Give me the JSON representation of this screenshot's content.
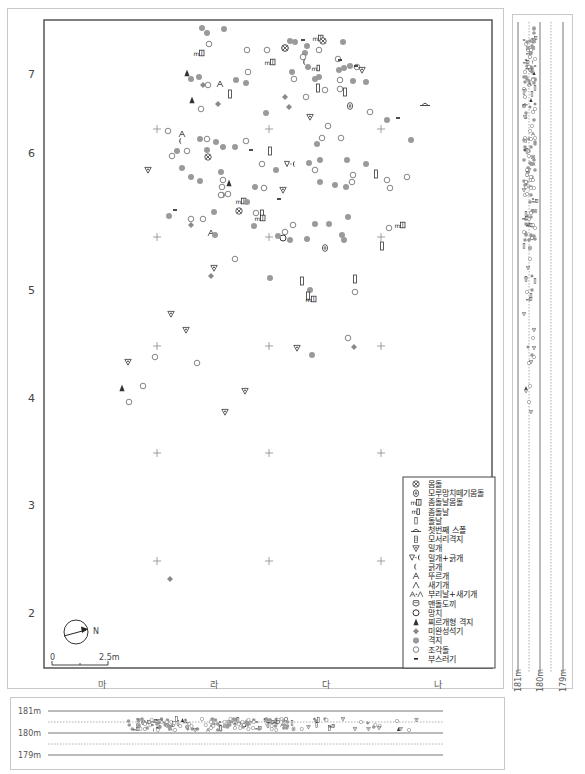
{
  "plan": {
    "y_axis_labels": [
      {
        "text": "7",
        "y": 78
      },
      {
        "text": "6",
        "y": 157
      },
      {
        "text": "5",
        "y": 294
      },
      {
        "text": "4",
        "y": 402
      },
      {
        "text": "3",
        "y": 509
      },
      {
        "text": "2",
        "y": 617
      }
    ],
    "x_axis_labels": [
      {
        "text": "마",
        "x": 102
      },
      {
        "text": "라",
        "x": 214
      },
      {
        "text": "다",
        "x": 326
      },
      {
        "text": "나",
        "x": 438
      }
    ],
    "north_label": "N",
    "scale": {
      "start": "0",
      "end": "2.5m"
    }
  },
  "legend": {
    "items": [
      {
        "symbol": "core",
        "label": "몸돌"
      },
      {
        "symbol": "anvil-core",
        "label": "모루망치떼기몸돌"
      },
      {
        "symbol": "microblade-core",
        "label": "좀돌날몸돌"
      },
      {
        "symbol": "microblade",
        "label": "좀돌날"
      },
      {
        "symbol": "blade",
        "label": "돌날"
      },
      {
        "symbol": "first-spall",
        "label": "첫번째 스폴"
      },
      {
        "symbol": "corner-flake",
        "label": "모서리격지"
      },
      {
        "symbol": "endscraper",
        "label": "밀개"
      },
      {
        "symbol": "endscraper-sidescraper",
        "label": "밀개+긁개"
      },
      {
        "symbol": "sidescraper",
        "label": "긁개"
      },
      {
        "symbol": "borer",
        "label": "뚜르개"
      },
      {
        "symbol": "burin",
        "label": "새기개"
      },
      {
        "symbol": "beak-burin",
        "label": "부리날+새기개"
      },
      {
        "symbol": "polished-axe",
        "label": "맨돌도끼"
      },
      {
        "symbol": "hammer",
        "label": "망치"
      },
      {
        "symbol": "point-flake",
        "label": "찌르개형 격지"
      },
      {
        "symbol": "unfinished",
        "label": "미완성석기"
      },
      {
        "symbol": "flake",
        "label": "격지"
      },
      {
        "symbol": "chunk",
        "label": "조각돌"
      },
      {
        "symbol": "debris",
        "label": "부스러기"
      }
    ]
  },
  "grid_crosses": [
    [
      157,
      129
    ],
    [
      269,
      129
    ],
    [
      381,
      129
    ],
    [
      157,
      237
    ],
    [
      269,
      237
    ],
    [
      381,
      237
    ],
    [
      157,
      346
    ],
    [
      269,
      346
    ],
    [
      381,
      346
    ],
    [
      157,
      453
    ],
    [
      269,
      453
    ],
    [
      381,
      453
    ],
    [
      157,
      561
    ],
    [
      269,
      561
    ],
    [
      381,
      561
    ]
  ],
  "artifacts": [
    {
      "t": "flake",
      "x": 202,
      "y": 28
    },
    {
      "t": "flake",
      "x": 207,
      "y": 33
    },
    {
      "t": "flake",
      "x": 224,
      "y": 29
    },
    {
      "t": "chunk",
      "x": 209,
      "y": 44
    },
    {
      "t": "microblade-core",
      "x": 199,
      "y": 53
    },
    {
      "t": "chunk",
      "x": 247,
      "y": 50
    },
    {
      "t": "core",
      "x": 285,
      "y": 48
    },
    {
      "t": "chunk",
      "x": 267,
      "y": 50
    },
    {
      "t": "microblade-core",
      "x": 270,
      "y": 62
    },
    {
      "t": "point-flake",
      "x": 187,
      "y": 73
    },
    {
      "t": "flake",
      "x": 191,
      "y": 79
    },
    {
      "t": "flake",
      "x": 199,
      "y": 77
    },
    {
      "t": "unfinished",
      "x": 203,
      "y": 85
    },
    {
      "t": "chunk",
      "x": 208,
      "y": 85
    },
    {
      "t": "borer",
      "x": 220,
      "y": 84
    },
    {
      "t": "flake",
      "x": 236,
      "y": 80
    },
    {
      "t": "flake",
      "x": 246,
      "y": 83
    },
    {
      "t": "chunk",
      "x": 248,
      "y": 72
    },
    {
      "t": "blade",
      "x": 230,
      "y": 94
    },
    {
      "t": "point-flake",
      "x": 192,
      "y": 100
    },
    {
      "t": "chunk",
      "x": 201,
      "y": 109
    },
    {
      "t": "unfinished",
      "x": 218,
      "y": 104
    },
    {
      "t": "unfinished",
      "x": 285,
      "y": 97
    },
    {
      "t": "unfinished",
      "x": 289,
      "y": 107
    },
    {
      "t": "flake",
      "x": 266,
      "y": 113
    },
    {
      "t": "core",
      "x": 285,
      "y": 48
    },
    {
      "t": "flake",
      "x": 295,
      "y": 42
    },
    {
      "t": "debris",
      "x": 303,
      "y": 40
    },
    {
      "t": "microblade-core",
      "x": 318,
      "y": 38
    },
    {
      "t": "core",
      "x": 323,
      "y": 41
    },
    {
      "t": "chunk",
      "x": 319,
      "y": 50
    },
    {
      "t": "flake",
      "x": 307,
      "y": 46
    },
    {
      "t": "flake",
      "x": 305,
      "y": 53
    },
    {
      "t": "chunk",
      "x": 303,
      "y": 57
    },
    {
      "t": "sidescraper",
      "x": 305,
      "y": 62
    },
    {
      "t": "flake",
      "x": 308,
      "y": 67
    },
    {
      "t": "microblade",
      "x": 316,
      "y": 68
    },
    {
      "t": "flake",
      "x": 319,
      "y": 77
    },
    {
      "t": "flake",
      "x": 315,
      "y": 79
    },
    {
      "t": "chunk",
      "x": 294,
      "y": 79
    },
    {
      "t": "flake",
      "x": 292,
      "y": 72
    },
    {
      "t": "blade",
      "x": 318,
      "y": 88
    },
    {
      "t": "chunk",
      "x": 325,
      "y": 90
    },
    {
      "t": "chunk",
      "x": 306,
      "y": 97
    },
    {
      "t": "flake",
      "x": 343,
      "y": 42
    },
    {
      "t": "chunk",
      "x": 338,
      "y": 59
    },
    {
      "t": "debris",
      "x": 340,
      "y": 60
    },
    {
      "t": "flake",
      "x": 339,
      "y": 70
    },
    {
      "t": "flake",
      "x": 344,
      "y": 68
    },
    {
      "t": "flake",
      "x": 350,
      "y": 66
    },
    {
      "t": "chunk",
      "x": 357,
      "y": 67
    },
    {
      "t": "debris",
      "x": 356,
      "y": 66
    },
    {
      "t": "endscraper",
      "x": 362,
      "y": 70
    },
    {
      "t": "chunk",
      "x": 340,
      "y": 80
    },
    {
      "t": "flake",
      "x": 353,
      "y": 81
    },
    {
      "t": "flake",
      "x": 366,
      "y": 82
    },
    {
      "t": "chunk",
      "x": 340,
      "y": 89
    },
    {
      "t": "blade",
      "x": 345,
      "y": 92
    },
    {
      "t": "anvil-core",
      "x": 350,
      "y": 106
    },
    {
      "t": "chunk",
      "x": 370,
      "y": 112
    },
    {
      "t": "debris",
      "x": 398,
      "y": 118
    },
    {
      "t": "flake",
      "x": 387,
      "y": 120
    },
    {
      "t": "first-spall",
      "x": 425,
      "y": 104
    },
    {
      "t": "endscraper",
      "x": 310,
      "y": 117
    },
    {
      "t": "chunk",
      "x": 328,
      "y": 126
    },
    {
      "t": "cross-fake",
      "x": 0,
      "y": 0
    },
    {
      "t": "chunk",
      "x": 168,
      "y": 131
    },
    {
      "t": "borer",
      "x": 182,
      "y": 134
    },
    {
      "t": "sidescraper",
      "x": 181,
      "y": 141
    },
    {
      "t": "flake",
      "x": 200,
      "y": 139
    },
    {
      "t": "chunk",
      "x": 207,
      "y": 139
    },
    {
      "t": "flake",
      "x": 216,
      "y": 142
    },
    {
      "t": "flake",
      "x": 223,
      "y": 147
    },
    {
      "t": "chunk",
      "x": 172,
      "y": 156
    },
    {
      "t": "flake",
      "x": 177,
      "y": 151
    },
    {
      "t": "chunk",
      "x": 187,
      "y": 151
    },
    {
      "t": "flake",
      "x": 207,
      "y": 150
    },
    {
      "t": "core",
      "x": 208,
      "y": 157
    },
    {
      "t": "flake",
      "x": 235,
      "y": 147
    },
    {
      "t": "chunk",
      "x": 246,
      "y": 141
    },
    {
      "t": "debris",
      "x": 251,
      "y": 150
    },
    {
      "t": "blade",
      "x": 270,
      "y": 151
    },
    {
      "t": "chunk",
      "x": 262,
      "y": 164
    },
    {
      "t": "flake",
      "x": 276,
      "y": 170
    },
    {
      "t": "endscraper-sidescraper",
      "x": 291,
      "y": 164
    },
    {
      "t": "endscraper",
      "x": 148,
      "y": 170
    },
    {
      "t": "flake",
      "x": 182,
      "y": 168
    },
    {
      "t": "flake",
      "x": 191,
      "y": 177
    },
    {
      "t": "flake",
      "x": 200,
      "y": 181
    },
    {
      "t": "flake",
      "x": 221,
      "y": 172
    },
    {
      "t": "chunk",
      "x": 223,
      "y": 180
    },
    {
      "t": "point-flake",
      "x": 229,
      "y": 183
    },
    {
      "t": "chunk",
      "x": 222,
      "y": 187
    },
    {
      "t": "flake",
      "x": 255,
      "y": 187
    },
    {
      "t": "chunk",
      "x": 264,
      "y": 188
    },
    {
      "t": "endscraper",
      "x": 283,
      "y": 190
    },
    {
      "t": "debris",
      "x": 279,
      "y": 199
    },
    {
      "t": "flake",
      "x": 222,
      "y": 195
    },
    {
      "t": "chunk",
      "x": 221,
      "y": 195
    },
    {
      "t": "chunk",
      "x": 228,
      "y": 194
    },
    {
      "t": "microblade-core",
      "x": 241,
      "y": 201
    },
    {
      "t": "flake",
      "x": 247,
      "y": 202
    },
    {
      "t": "core",
      "x": 239,
      "y": 211
    },
    {
      "t": "debris",
      "x": 175,
      "y": 210
    },
    {
      "t": "flake",
      "x": 169,
      "y": 216
    },
    {
      "t": "chunk",
      "x": 203,
      "y": 219
    },
    {
      "t": "flake",
      "x": 214,
      "y": 212
    },
    {
      "t": "unfinished",
      "x": 191,
      "y": 225
    },
    {
      "t": "chunk",
      "x": 191,
      "y": 219
    },
    {
      "t": "borer",
      "x": 211,
      "y": 233
    },
    {
      "t": "flake",
      "x": 215,
      "y": 235
    },
    {
      "t": "chunk",
      "x": 256,
      "y": 213
    },
    {
      "t": "blade",
      "x": 262,
      "y": 214
    },
    {
      "t": "microblade-core",
      "x": 260,
      "y": 218
    },
    {
      "t": "flake",
      "x": 254,
      "y": 226
    },
    {
      "t": "hammer",
      "x": 283,
      "y": 238
    },
    {
      "t": "flake",
      "x": 278,
      "y": 236
    },
    {
      "t": "chunk",
      "x": 285,
      "y": 232
    },
    {
      "t": "chunk",
      "x": 293,
      "y": 225
    },
    {
      "t": "flake",
      "x": 290,
      "y": 240
    },
    {
      "t": "flake",
      "x": 317,
      "y": 144
    },
    {
      "t": "chunk",
      "x": 322,
      "y": 138
    },
    {
      "t": "chunk",
      "x": 341,
      "y": 138
    },
    {
      "t": "flake",
      "x": 309,
      "y": 163
    },
    {
      "t": "flake",
      "x": 320,
      "y": 160
    },
    {
      "t": "flake",
      "x": 347,
      "y": 160
    },
    {
      "t": "chunk",
      "x": 315,
      "y": 170
    },
    {
      "t": "flake",
      "x": 320,
      "y": 182
    },
    {
      "t": "flake",
      "x": 335,
      "y": 185
    },
    {
      "t": "flake",
      "x": 346,
      "y": 187
    },
    {
      "t": "chunk",
      "x": 352,
      "y": 182
    },
    {
      "t": "blade",
      "x": 376,
      "y": 174
    },
    {
      "t": "chunk",
      "x": 387,
      "y": 180
    },
    {
      "t": "chunk",
      "x": 390,
      "y": 188
    },
    {
      "t": "chunk",
      "x": 407,
      "y": 177
    },
    {
      "t": "flake",
      "x": 366,
      "y": 164
    },
    {
      "t": "chunk",
      "x": 353,
      "y": 175
    },
    {
      "t": "flake",
      "x": 315,
      "y": 224
    },
    {
      "t": "flake",
      "x": 329,
      "y": 224
    },
    {
      "t": "flake",
      "x": 348,
      "y": 217
    },
    {
      "t": "flake",
      "x": 342,
      "y": 235
    },
    {
      "t": "flake",
      "x": 344,
      "y": 240
    },
    {
      "t": "flake",
      "x": 307,
      "y": 239
    },
    {
      "t": "anvil-core",
      "x": 325,
      "y": 248
    },
    {
      "t": "chunk",
      "x": 389,
      "y": 228
    },
    {
      "t": "microblade-core",
      "x": 400,
      "y": 225
    },
    {
      "t": "blade",
      "x": 382,
      "y": 246
    },
    {
      "t": "flake",
      "x": 411,
      "y": 140
    },
    {
      "t": "flake",
      "x": 290,
      "y": 41
    },
    {
      "t": "chunk",
      "x": 235,
      "y": 259
    },
    {
      "t": "endscraper",
      "x": 214,
      "y": 268
    },
    {
      "t": "unfinished",
      "x": 211,
      "y": 276
    },
    {
      "t": "flake",
      "x": 270,
      "y": 278
    },
    {
      "t": "blade",
      "x": 302,
      "y": 281
    },
    {
      "t": "flake",
      "x": 310,
      "y": 290
    },
    {
      "t": "blade",
      "x": 308,
      "y": 296
    },
    {
      "t": "microblade-core",
      "x": 311,
      "y": 299
    },
    {
      "t": "blade",
      "x": 355,
      "y": 279
    },
    {
      "t": "chunk",
      "x": 355,
      "y": 292
    },
    {
      "t": "endscraper",
      "x": 171,
      "y": 314
    },
    {
      "t": "endscraper",
      "x": 186,
      "y": 330
    },
    {
      "t": "chunk",
      "x": 155,
      "y": 357
    },
    {
      "t": "chunk",
      "x": 197,
      "y": 363
    },
    {
      "t": "endscraper",
      "x": 297,
      "y": 348
    },
    {
      "t": "flake",
      "x": 312,
      "y": 355
    },
    {
      "t": "chunk",
      "x": 348,
      "y": 338
    },
    {
      "t": "unfinished",
      "x": 354,
      "y": 347
    },
    {
      "t": "endscraper",
      "x": 128,
      "y": 362
    },
    {
      "t": "point-flake",
      "x": 122,
      "y": 388
    },
    {
      "t": "chunk",
      "x": 143,
      "y": 386
    },
    {
      "t": "chunk",
      "x": 129,
      "y": 402
    },
    {
      "t": "endscraper",
      "x": 245,
      "y": 391
    },
    {
      "t": "endscraper",
      "x": 225,
      "y": 412
    },
    {
      "t": "unfinished",
      "x": 170,
      "y": 579
    }
  ],
  "side_profile": {
    "labels": [
      "181m",
      "180m",
      "179m"
    ]
  },
  "bottom_profile": {
    "labels": [
      "181m",
      "180m",
      "179m"
    ]
  }
}
